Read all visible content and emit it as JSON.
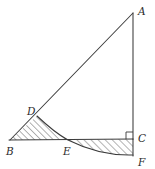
{
  "figure": {
    "type": "geometry-diagram",
    "width": 155,
    "height": 169,
    "background_color": "#ffffff",
    "stroke_color": "#3a3a3a",
    "hatch_color": "#4a4a4a",
    "label_color": "#2b2b2b",
    "points": [
      {
        "id": "A",
        "label": "A",
        "x": 133,
        "y": 13,
        "label_x": 139,
        "label_y": 11
      },
      {
        "id": "B",
        "label": "B",
        "x": 10,
        "y": 140,
        "label_x": 7,
        "label_y": 153
      },
      {
        "id": "C",
        "label": "C",
        "x": 133,
        "y": 139,
        "label_x": 139,
        "label_y": 140
      },
      {
        "id": "D",
        "label": "D",
        "x": 37,
        "y": 116,
        "label_x": 28,
        "label_y": 113
      },
      {
        "id": "E",
        "label": "E",
        "x": 68,
        "y": 140,
        "label_x": 65,
        "label_y": 153
      },
      {
        "id": "F",
        "label": "F",
        "x": 133,
        "y": 155,
        "label_x": 139,
        "label_y": 163
      }
    ],
    "segments": [
      {
        "name": "segment-BA",
        "from": "B",
        "to": "A"
      },
      {
        "name": "segment-AC",
        "from": "A",
        "to": "C"
      },
      {
        "name": "segment-BC",
        "from": "B",
        "to": "C"
      },
      {
        "name": "segment-CF",
        "from": "C",
        "to": "F"
      }
    ],
    "curve": {
      "name": "arc-D-E-F",
      "description": "Smooth arc passing through D, E and F",
      "path": "M 37 116 Q 55 133 68 140 Q 100 156 133 155"
    },
    "right_angle": {
      "name": "right-angle-at-C",
      "vertex": "C",
      "size": 7
    },
    "regions": [
      {
        "name": "hatched-region-BDE",
        "vertices": "B-D-arc-E",
        "hatch_direction": "forward-slash",
        "path": "M 10 140 L 37 116 Q 55 133 68 140 Z"
      },
      {
        "name": "hatched-region-ECF",
        "vertices": "E-C-F-arc",
        "hatch_direction": "forward-slash",
        "path": "M 68 140 L 133 139 L 133 155 Q 100 156 68 140 Z"
      }
    ]
  }
}
